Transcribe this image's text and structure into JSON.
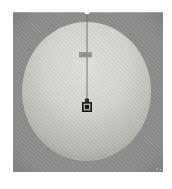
{
  "scene": {
    "elements": [
      "viewport-canvas",
      "sphere",
      "pivot-dot",
      "plumb-line",
      "string-marker",
      "bob-knob",
      "bob",
      "bob-inner-ring"
    ],
    "colors": {
      "page_background": "#ffffff",
      "viewport_background": "#8c8c8a",
      "viewport_top_highlight": "#b6b6b4",
      "sphere_highlight": "#e0e0db",
      "sphere_light": "#d2d2cd",
      "sphere_mid": "#b8b8b2",
      "sphere_shadow": "#9a9a94",
      "sphere_edge": "#8f8f89",
      "pivot_dot": "#fafaf8",
      "plumb_line": "#6c6c64",
      "string_marker_fill": "#9c9c93",
      "string_marker_border": "#82827a",
      "string_marker_smudge": "#787870",
      "bob_knob": "#292925",
      "bob_outer": "#141412",
      "bob_ring": "#d4d4cf",
      "bob_core": "#1d1d1b",
      "hatch_line": "#ffffff",
      "vignette": "#000000",
      "artifact_speck": "#c9c9c5"
    }
  }
}
